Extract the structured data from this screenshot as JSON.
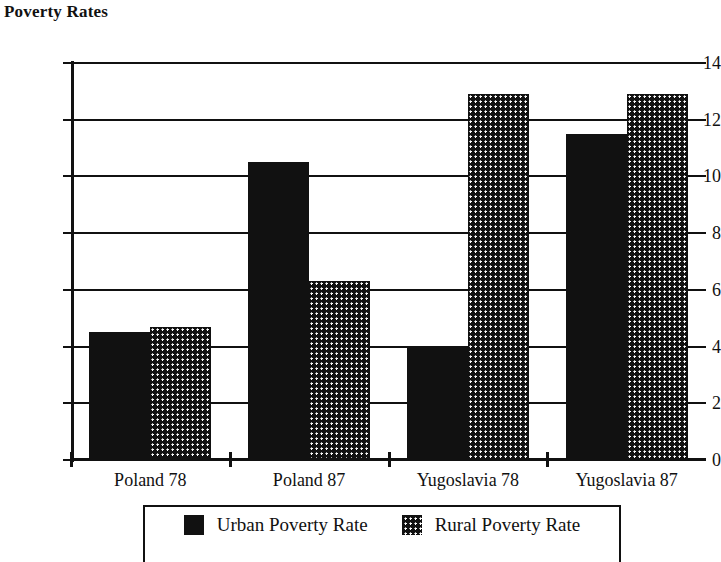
{
  "chart_data": {
    "type": "bar",
    "title": "Poverty Rates",
    "xlabel": "",
    "ylabel": "",
    "ylim": [
      0,
      14
    ],
    "yticks": [
      0,
      2,
      4,
      6,
      8,
      10,
      12,
      14
    ],
    "ytick_labels": [
      "0",
      "2",
      "4",
      "6",
      "8",
      "10",
      "12",
      "14"
    ],
    "grid": true,
    "legend_position": "bottom",
    "categories": [
      "Poland 78",
      "Poland 87",
      "Yugoslavia 78",
      "Yugoslavia 87"
    ],
    "series": [
      {
        "name": "Urban Poverty Rate",
        "fill": "solid-black",
        "color": "#111111",
        "values": [
          4.5,
          10.5,
          4.0,
          11.5
        ]
      },
      {
        "name": "Rural Poverty Rate",
        "fill": "white-dotted-on-black",
        "color": "#111111",
        "values": [
          4.7,
          6.3,
          12.9,
          12.9
        ]
      }
    ]
  },
  "legend": {
    "entries": [
      {
        "label": "Urban Poverty Rate",
        "swatch": "solid-swatch-icon"
      },
      {
        "label": "Rural Poverty Rate",
        "swatch": "stipple-swatch-icon"
      }
    ]
  }
}
